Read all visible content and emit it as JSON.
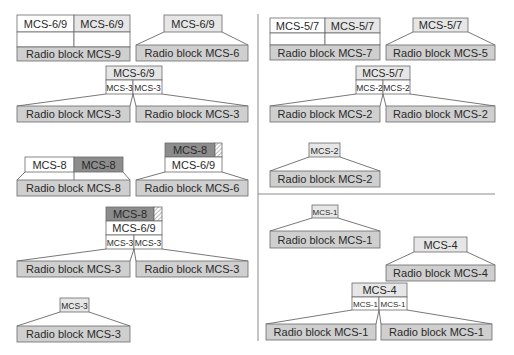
{
  "colors": {
    "radio_block_fill": "#cfcfcf",
    "header_light_fill": "#e6e6e6",
    "header_dark_fill": "#8c8c8c",
    "cell_fill": "#ffffff",
    "outline": "#6a6a6a",
    "divider": "#8a8a8a"
  },
  "left_panel": {
    "mcs9_family": {
      "block_mcs9": {
        "cells": [
          "MCS-6/9",
          "MCS-6/9"
        ],
        "radio_block": "Radio block MCS-9"
      },
      "block_mcs6": {
        "header": "MCS-6/9",
        "radio_block": "Radio block MCS-6"
      },
      "block_mcs3_split": {
        "header": "MCS-6/9",
        "sub_cells": [
          "MCS-3",
          "MCS-3"
        ],
        "radio_blocks": [
          "Radio block MCS-3",
          "Radio block MCS-3"
        ]
      }
    },
    "mcs8_family": {
      "block_mcs8": {
        "cells": [
          "MCS-8",
          "MCS-8"
        ],
        "radio_block": "Radio block MCS-8"
      },
      "block_mcs6_padded": {
        "header": "MCS-8",
        "sub_header": "MCS-6/9",
        "radio_block": "Radio block MCS-6"
      },
      "block_mcs3_padded_split": {
        "header": "MCS-8",
        "sub_header": "MCS-6/9",
        "sub_cells": [
          "MCS-3",
          "MCS-3"
        ],
        "radio_blocks": [
          "Radio block MCS-3",
          "Radio block MCS-3"
        ]
      },
      "block_mcs3_single": {
        "header": "MCS-3",
        "radio_block": "Radio block MCS-3"
      }
    }
  },
  "right_panel": {
    "mcs7_family": {
      "block_mcs7": {
        "cells": [
          "MCS-5/7",
          "MCS-5/7"
        ],
        "radio_block": "Radio block MCS-7"
      },
      "block_mcs5": {
        "header": "MCS-5/7",
        "radio_block": "Radio block MCS-5"
      },
      "block_mcs2_split": {
        "header": "MCS-5/7",
        "sub_cells": [
          "MCS-2",
          "MCS-2"
        ],
        "radio_blocks": [
          "Radio block MCS-2",
          "Radio block MCS-2"
        ]
      },
      "block_mcs2_single": {
        "header": "MCS-2",
        "radio_block": "Radio block MCS-2"
      }
    },
    "mcs4_family": {
      "block_mcs1_single": {
        "header": "MCS-1",
        "radio_block": "Radio block MCS-1"
      },
      "block_mcs4": {
        "header": "MCS-4",
        "radio_block": "Radio block MCS-4"
      },
      "block_mcs1_split": {
        "header": "MCS-4",
        "sub_cells": [
          "MCS-1",
          "MCS-1"
        ],
        "radio_blocks": [
          "Radio block MCS-1",
          "Radio block MCS-1"
        ]
      }
    }
  }
}
